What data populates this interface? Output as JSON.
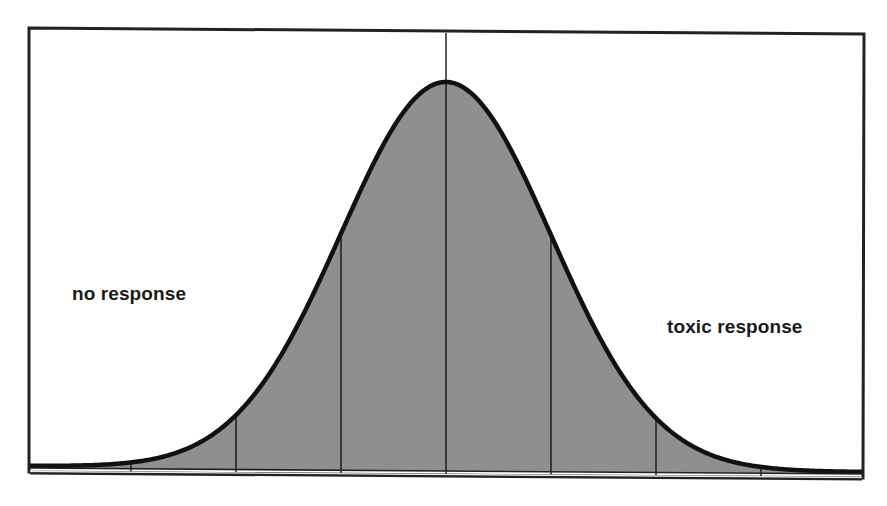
{
  "chart_data": {
    "type": "area",
    "title": "",
    "xlabel": "",
    "ylabel": "",
    "distribution": {
      "kind": "normal",
      "mean": 0,
      "sd": 1
    },
    "x_range_sd": [
      -3.95,
      3.9
    ],
    "sd_lines": [
      -3,
      -2,
      -1,
      0,
      1,
      2,
      3
    ],
    "annotations": [
      {
        "text": "no response",
        "position": "left tail"
      },
      {
        "text": "toxic response",
        "position": "right tail"
      }
    ],
    "grid": false,
    "legend": "none",
    "colors": {
      "fill": "#8f8f8f",
      "curve": "#111111",
      "frame": "#222222",
      "background": "#ffffff"
    }
  },
  "labels": {
    "left": "no response",
    "right": "toxic response"
  }
}
